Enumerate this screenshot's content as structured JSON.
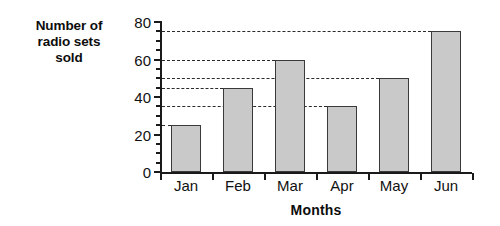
{
  "chart_data": {
    "type": "bar",
    "title": "",
    "categories": [
      "Jan",
      "Feb",
      "Mar",
      "Apr",
      "May",
      "Jun"
    ],
    "values": [
      25,
      45,
      60,
      35,
      50,
      75
    ],
    "xlabel": "Months",
    "ylabel": "Number of radio sets sold",
    "ylabel_lines": [
      "Number of",
      "radio sets",
      "sold"
    ],
    "ylim": [
      0,
      80
    ],
    "ytick_labels": [
      "0",
      "20",
      "40",
      "60",
      "80"
    ],
    "ytick_values": [
      0,
      20,
      40,
      60,
      80
    ],
    "yminor_tick_step": 5,
    "grid": false,
    "guide_lines": "dashed leader line from y-axis to top of each bar",
    "legend": null,
    "colors": {
      "bar_fill": "#c9c9c9",
      "bar_border": "#3a3a3a",
      "axis": "#1a1a1a",
      "guide_line": "#2b2b2b",
      "text": "#111111",
      "background": "#ffffff"
    }
  }
}
